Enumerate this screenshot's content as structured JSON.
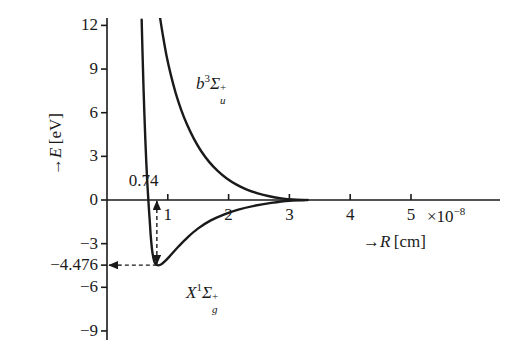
{
  "figure": {
    "background": "#ffffff",
    "ink": "#1a1a1a",
    "y_axis_title": "→E [eV]",
    "x_axis_title": "→R [cm]",
    "x_exponent_label": "×10",
    "x_exponent_power": "−8"
  },
  "chart_data": {
    "type": "line",
    "title": "",
    "xlabel": "→R [cm]",
    "ylabel": "→E [eV]",
    "xlim": [
      0,
      5.9
    ],
    "ylim": [
      -10.5,
      13.0
    ],
    "x_unit_factor": "×10⁻⁸ cm",
    "grid": false,
    "legend": "inline-annotations",
    "xticks": [
      "1",
      "2",
      "3",
      "4",
      "5"
    ],
    "xtick_values": [
      1,
      2,
      3,
      4,
      5
    ],
    "yticks": [
      "12",
      "9",
      "6",
      "3",
      "0",
      "−3",
      "−6",
      "−9"
    ],
    "ytick_values": [
      12,
      9,
      6,
      3,
      0,
      -3,
      -6,
      -9
    ],
    "special_ytick": {
      "label": "−4.476",
      "value": -4.476
    },
    "series": [
      {
        "name": "X¹Σg⁺",
        "label_parts": {
          "letter": "X",
          "super": "1",
          "sigma": "Σ",
          "sub": "g",
          "charge": "+"
        },
        "type": "bound-ground-state",
        "dissociation_energy_eV": 4.476,
        "equilibrium_separation": 0.74,
        "points": [
          [
            0.57,
            12.4
          ],
          [
            0.585,
            10.0
          ],
          [
            0.6,
            7.8
          ],
          [
            0.615,
            5.9
          ],
          [
            0.63,
            4.2
          ],
          [
            0.645,
            2.7
          ],
          [
            0.66,
            1.4
          ],
          [
            0.675,
            0.35
          ],
          [
            0.69,
            -0.65
          ],
          [
            0.705,
            -1.55
          ],
          [
            0.72,
            -2.5
          ],
          [
            0.745,
            -3.55
          ],
          [
            0.78,
            -4.25
          ],
          [
            0.82,
            -4.47
          ],
          [
            0.88,
            -4.45
          ],
          [
            0.95,
            -4.22
          ],
          [
            1.05,
            -3.78
          ],
          [
            1.18,
            -3.18
          ],
          [
            1.33,
            -2.55
          ],
          [
            1.5,
            -1.95
          ],
          [
            1.7,
            -1.42
          ],
          [
            1.92,
            -1.0
          ],
          [
            2.16,
            -0.66
          ],
          [
            2.42,
            -0.4
          ],
          [
            2.7,
            -0.2
          ],
          [
            3.0,
            -0.05
          ],
          [
            3.3,
            0.0
          ]
        ]
      },
      {
        "name": "b³Σu⁺",
        "label_parts": {
          "letter": "b",
          "super": "3",
          "sigma": "Σ",
          "sub": "u",
          "charge": "+"
        },
        "type": "repulsive-excited-state",
        "points": [
          [
            0.87,
            12.6
          ],
          [
            0.92,
            11.3
          ],
          [
            0.98,
            9.9
          ],
          [
            1.05,
            8.6
          ],
          [
            1.13,
            7.35
          ],
          [
            1.22,
            6.2
          ],
          [
            1.32,
            5.15
          ],
          [
            1.43,
            4.2
          ],
          [
            1.55,
            3.35
          ],
          [
            1.68,
            2.62
          ],
          [
            1.82,
            2.0
          ],
          [
            1.97,
            1.48
          ],
          [
            2.13,
            1.06
          ],
          [
            2.3,
            0.72
          ],
          [
            2.48,
            0.46
          ],
          [
            2.67,
            0.26
          ],
          [
            2.87,
            0.11
          ],
          [
            3.05,
            0.03
          ],
          [
            3.25,
            0.0
          ]
        ]
      }
    ],
    "annotations": [
      {
        "name": "bond-length-annotation",
        "text": "0.74",
        "kind": "double-arrow-vertical-dashed",
        "x": 0.82,
        "from_y": 0.0,
        "to_y": -4.476
      },
      {
        "name": "well-depth-annotation",
        "text": "−4.476",
        "kind": "arrow-horizontal-dashed",
        "y": -4.476
      }
    ]
  },
  "labels": {
    "excited_state": "b",
    "ground_state": "X",
    "bond_length": "0.74",
    "well_depth": "−4.476"
  }
}
